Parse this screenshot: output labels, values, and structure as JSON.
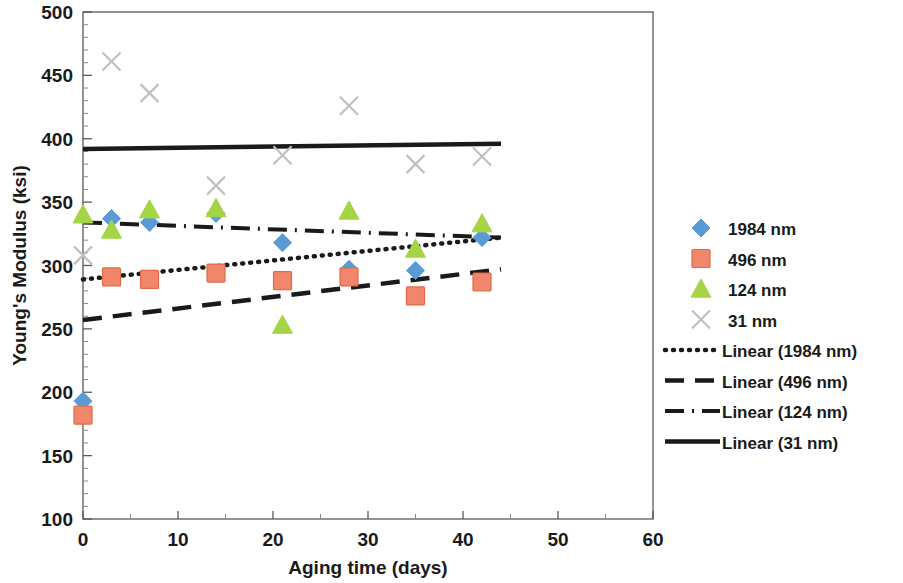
{
  "chart_data": {
    "type": "scatter",
    "title": "",
    "xlabel": "Aging time (days)",
    "ylabel": "Young's Modulus (ksi)",
    "xlim": [
      0,
      60
    ],
    "ylim": [
      100,
      500
    ],
    "x_ticks": [
      0,
      10,
      20,
      30,
      40,
      50,
      60
    ],
    "y_ticks": [
      100,
      150,
      200,
      250,
      300,
      350,
      400,
      450,
      500
    ],
    "x_minor_step": 5,
    "y_minor_step": 10,
    "grid": false,
    "legend_position": "right",
    "series": [
      {
        "name": "1984 nm",
        "marker": "diamond",
        "color": "#5B9BD5",
        "points": [
          {
            "x": 0,
            "y": 193
          },
          {
            "x": 3,
            "y": 337
          },
          {
            "x": 7,
            "y": 334
          },
          {
            "x": 14,
            "y": 341
          },
          {
            "x": 21,
            "y": 318
          },
          {
            "x": 28,
            "y": 297
          },
          {
            "x": 35,
            "y": 296
          },
          {
            "x": 42,
            "y": 322
          }
        ]
      },
      {
        "name": "496 nm",
        "marker": "square",
        "color": "#F0876A",
        "points": [
          {
            "x": 0,
            "y": 182
          },
          {
            "x": 3,
            "y": 291
          },
          {
            "x": 7,
            "y": 289
          },
          {
            "x": 14,
            "y": 294
          },
          {
            "x": 21,
            "y": 288
          },
          {
            "x": 28,
            "y": 291
          },
          {
            "x": 35,
            "y": 276
          },
          {
            "x": 42,
            "y": 287
          }
        ]
      },
      {
        "name": "124 nm",
        "marker": "triangle",
        "color": "#A5D447",
        "points": [
          {
            "x": 0,
            "y": 340
          },
          {
            "x": 3,
            "y": 328
          },
          {
            "x": 7,
            "y": 344
          },
          {
            "x": 14,
            "y": 345
          },
          {
            "x": 21,
            "y": 253
          },
          {
            "x": 28,
            "y": 343
          },
          {
            "x": 35,
            "y": 313
          },
          {
            "x": 42,
            "y": 333
          }
        ]
      },
      {
        "name": "31 nm",
        "marker": "cross",
        "color": "#BFBFBF",
        "points": [
          {
            "x": 0,
            "y": 308
          },
          {
            "x": 3,
            "y": 461
          },
          {
            "x": 7,
            "y": 436
          },
          {
            "x": 14,
            "y": 363
          },
          {
            "x": 21,
            "y": 387
          },
          {
            "x": 28,
            "y": 426
          },
          {
            "x": 35,
            "y": 380
          },
          {
            "x": 42,
            "y": 386
          }
        ]
      }
    ],
    "trendlines": [
      {
        "name": "Linear (1984 nm)",
        "style": "dotted",
        "color": "#1a1a1a",
        "x0": 0,
        "y0": 289,
        "x1": 44,
        "y1": 322
      },
      {
        "name": "Linear (496 nm)",
        "style": "dashed",
        "color": "#1a1a1a",
        "x0": 0,
        "y0": 257,
        "x1": 44,
        "y1": 297
      },
      {
        "name": "Linear (124 nm)",
        "style": "dashdot",
        "color": "#1a1a1a",
        "x0": 0,
        "y0": 334,
        "x1": 44,
        "y1": 322
      },
      {
        "name": "Linear (31 nm)",
        "style": "solid",
        "color": "#1a1a1a",
        "x0": 0,
        "y0": 392,
        "x1": 44,
        "y1": 396
      }
    ]
  },
  "axes": {
    "x_title": "Aging time (days)",
    "y_title": "Young's Modulus (ksi)",
    "x_tick_labels": [
      "0",
      "10",
      "20",
      "30",
      "40",
      "50",
      "60"
    ],
    "y_tick_labels": [
      "100",
      "150",
      "200",
      "250",
      "300",
      "350",
      "400",
      "450",
      "500"
    ]
  },
  "legend": {
    "entries": [
      {
        "label": "1984 nm",
        "kind": "marker",
        "marker": "diamond",
        "color": "#5B9BD5"
      },
      {
        "label": "496 nm",
        "kind": "marker",
        "marker": "square",
        "color": "#F0876A"
      },
      {
        "label": "124 nm",
        "kind": "marker",
        "marker": "triangle",
        "color": "#A5D447"
      },
      {
        "label": "31 nm",
        "kind": "marker",
        "marker": "cross",
        "color": "#BFBFBF"
      },
      {
        "label": "Linear (1984 nm)",
        "kind": "line",
        "style": "dotted",
        "color": "#1a1a1a"
      },
      {
        "label": "Linear (496 nm)",
        "kind": "line",
        "style": "dashed",
        "color": "#1a1a1a"
      },
      {
        "label": "Linear (124 nm)",
        "kind": "line",
        "style": "dashdot",
        "color": "#1a1a1a"
      },
      {
        "label": "Linear (31 nm)",
        "kind": "line",
        "style": "solid",
        "color": "#1a1a1a"
      }
    ]
  },
  "colors": {
    "axis": "#595959",
    "text": "#1a1a1a",
    "background": "#ffffff"
  }
}
